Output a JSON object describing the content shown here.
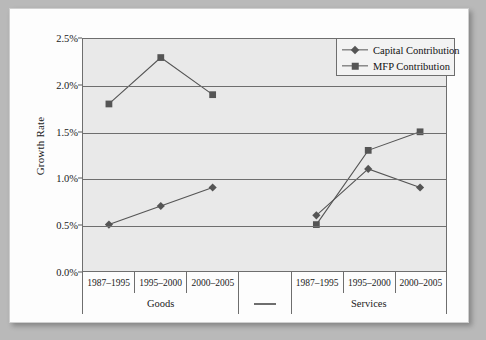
{
  "chart_data": {
    "type": "line",
    "title": "",
    "xlabel": "",
    "ylabel": "Growth Rate",
    "ylim": [
      0.0,
      2.5
    ],
    "ytick_labels": [
      "0.0%",
      "0.5%",
      "1.0%",
      "1.5%",
      "2.0%",
      "2.5%"
    ],
    "ytick_values": [
      0.0,
      0.5,
      1.0,
      1.5,
      2.0,
      2.5
    ],
    "grid": true,
    "legend_position": "top-right",
    "groups": [
      {
        "name": "Goods",
        "categories": [
          "1987–1995",
          "1995–2000",
          "2000–2005"
        ]
      },
      {
        "name": "—",
        "categories": [
          ""
        ]
      },
      {
        "name": "Services",
        "categories": [
          "1987–1995",
          "1995–2000",
          "2000–2005"
        ]
      }
    ],
    "categories": [
      "1987–1995",
      "1995–2000",
      "2000–2005",
      "",
      "1987–1995",
      "1995–2000",
      "2000–2005"
    ],
    "series": [
      {
        "name": "Capital Contribution",
        "marker": "diamond",
        "color": "#555555",
        "values": [
          0.5,
          0.7,
          0.9,
          null,
          0.6,
          1.1,
          0.9
        ]
      },
      {
        "name": "MFP Contribution",
        "marker": "square",
        "color": "#555555",
        "values": [
          1.8,
          2.3,
          1.9,
          null,
          0.5,
          1.3,
          1.5
        ]
      }
    ]
  },
  "legend": {
    "items": [
      {
        "label": "Capital Contribution",
        "marker": "diamond"
      },
      {
        "label": "MFP Contribution",
        "marker": "square"
      }
    ]
  },
  "colors": {
    "series": "#555555",
    "grid": "#6e6e6e",
    "plot_background": "#e9e9e9",
    "page_background": "#fdfdfd",
    "frame": "#b9b9b9"
  }
}
